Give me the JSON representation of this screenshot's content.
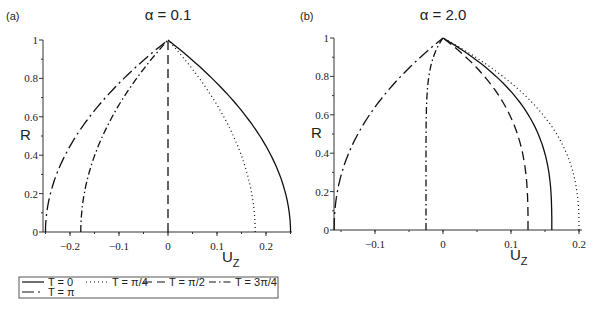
{
  "chart_data": [
    {
      "type": "line",
      "panel_label": "(a)",
      "title": "α = 0.1",
      "xlabel": "U_z",
      "ylabel": "R",
      "xlim": [
        -0.25,
        0.25
      ],
      "ylim": [
        0,
        1
      ],
      "xticks": [
        -0.2,
        -0.1,
        0,
        0.1,
        0.2
      ],
      "xtick_labels": [
        "−0.2",
        "−0.1",
        "0",
        "0.1",
        "0.2"
      ],
      "yticks": [
        0,
        0.2,
        0.4,
        0.6,
        0.8,
        1
      ],
      "ytick_labels": [
        "0",
        "0.2",
        "0.4",
        "0.6",
        "0.8",
        "1"
      ],
      "grid": false,
      "series": [
        {
          "name": "T = 0",
          "style": "solid",
          "U_at_R0": 0.25,
          "shape": 2
        },
        {
          "name": "T = π/4",
          "style": "dotted",
          "U_at_R0": 0.178,
          "shape": 2
        },
        {
          "name": "T = π/2",
          "style": "dashed",
          "U_at_R0": 0.0,
          "shape": 2
        },
        {
          "name": "T = 3π/4",
          "style": "dashdot",
          "U_at_R0": -0.178,
          "shape": 2
        },
        {
          "name": "T = π",
          "style": "longdash",
          "U_at_R0": -0.25,
          "shape": 2
        }
      ]
    },
    {
      "type": "line",
      "panel_label": "(b)",
      "title": "α = 2.0",
      "xlabel": "U_z",
      "ylabel": "R",
      "xlim": [
        -0.16,
        0.2
      ],
      "ylim": [
        0,
        1
      ],
      "xticks": [
        -0.1,
        0,
        0.1,
        0.2
      ],
      "xtick_labels": [
        "−0.1",
        "0",
        "0.1",
        "0.2"
      ],
      "yticks": [
        0,
        0.2,
        0.4,
        0.6,
        0.8,
        1
      ],
      "ytick_labels": [
        "0",
        "0.2",
        "0.4",
        "0.6",
        "0.8",
        "1"
      ],
      "grid": false,
      "series": [
        {
          "name": "T = 0",
          "style": "solid",
          "U_at_R0": 0.16,
          "shape": 3
        },
        {
          "name": "T = π/4",
          "style": "dotted",
          "U_at_R0": 0.2,
          "shape": 2.6
        },
        {
          "name": "T = π/2",
          "style": "dashed",
          "U_at_R0": 0.125,
          "shape": 3
        },
        {
          "name": "T = 3π/4",
          "style": "dashdot",
          "U_at_R0": -0.025,
          "shape": 8
        },
        {
          "name": "T = π",
          "style": "longdash",
          "U_at_R0": -0.16,
          "shape": 2.2
        }
      ]
    }
  ],
  "legend": {
    "entries": [
      "T = 0",
      "T = π/4",
      "T = π/2",
      "T = 3π/4",
      "T = π"
    ]
  }
}
